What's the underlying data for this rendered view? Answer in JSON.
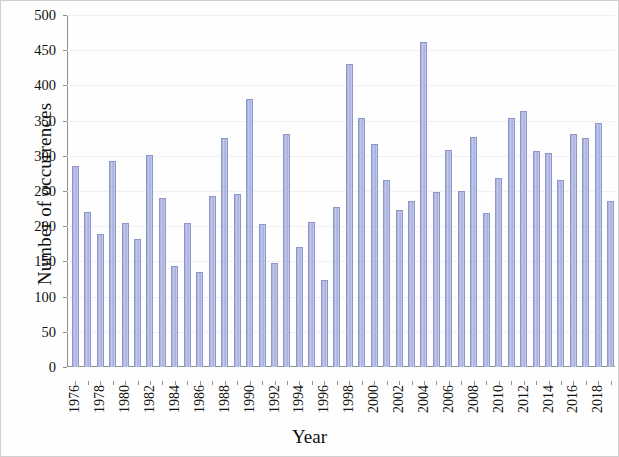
{
  "chart_data": {
    "type": "bar",
    "title": "",
    "xlabel": "Year",
    "ylabel": "Number of occurrences",
    "ylim": [
      0,
      500
    ],
    "ytick_step": 50,
    "yticks": [
      0,
      50,
      100,
      150,
      200,
      250,
      300,
      350,
      400,
      450,
      500
    ],
    "grid": true,
    "legend": null,
    "bar_color": "#aab2dd",
    "bar_edge_color": "#8e97c9",
    "xtick_labels": [
      "1976",
      "1978",
      "1980",
      "1982",
      "1984",
      "1986",
      "1988",
      "1990",
      "1992",
      "1994",
      "1996",
      "1998",
      "2000",
      "2002",
      "2004",
      "2006",
      "2008",
      "2010",
      "2012",
      "2014",
      "2016",
      "2018"
    ],
    "xtick_label_rotation": 90,
    "xtick_label_interval": 2,
    "categories": [
      "1976",
      "1977",
      "1978",
      "1979",
      "1980",
      "1981",
      "1982",
      "1983",
      "1984",
      "1985",
      "1986",
      "1987",
      "1988",
      "1989",
      "1990",
      "1991",
      "1992",
      "1993",
      "1994",
      "1995",
      "1996",
      "1997",
      "1998",
      "1999",
      "2000",
      "2001",
      "2002",
      "2003",
      "2004",
      "2005",
      "2006",
      "2007",
      "2008",
      "2009",
      "2010",
      "2011",
      "2012",
      "2013",
      "2014",
      "2015",
      "2016",
      "2017",
      "2018",
      "2019"
    ],
    "values": [
      286,
      220,
      189,
      292,
      205,
      182,
      301,
      240,
      144,
      204,
      135,
      243,
      326,
      246,
      381,
      203,
      148,
      331,
      170,
      206,
      124,
      228,
      430,
      354,
      317,
      265,
      223,
      236,
      461,
      249,
      308,
      250,
      327,
      219,
      268,
      354,
      363,
      307,
      304,
      265,
      331,
      325,
      347,
      236
    ]
  }
}
